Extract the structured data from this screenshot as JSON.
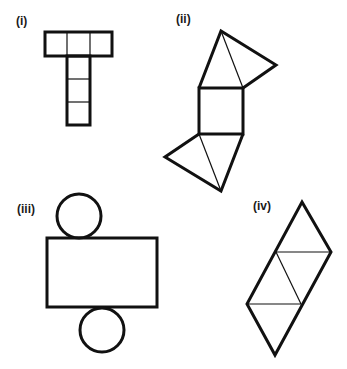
{
  "figures": [
    {
      "id": "i",
      "label": "(i)",
      "shape": "T-shaped net of squares (3 across top, 3 down stem)"
    },
    {
      "id": "ii",
      "label": "(ii)",
      "shape": "square with four triangles (net of square pyramid variant)"
    },
    {
      "id": "iii",
      "label": "(iii)",
      "shape": "rectangle with two circles (net of cylinder)"
    },
    {
      "id": "iv",
      "label": "(iv)",
      "shape": "parallelogram of four triangles (net of tetrahedron)"
    }
  ],
  "colors": {
    "stroke": "#111111",
    "background": "#ffffff"
  }
}
